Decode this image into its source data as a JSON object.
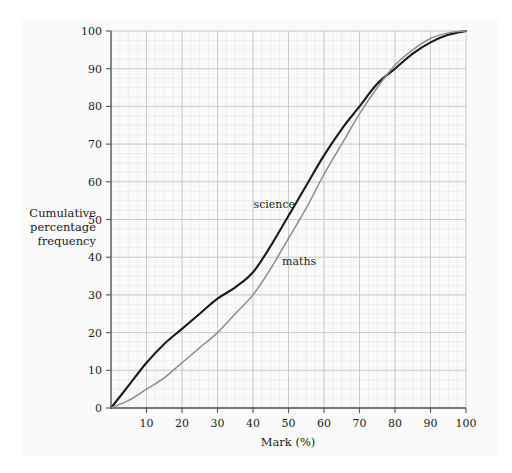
{
  "chart_data": {
    "type": "line",
    "title": "",
    "subtitle": "",
    "xlabel": "Mark (%)",
    "ylabel": "Cumulative percentage frequency",
    "xlim": [
      0,
      100
    ],
    "ylim": [
      0,
      100
    ],
    "xticks": [
      0,
      10,
      20,
      30,
      40,
      50,
      60,
      70,
      80,
      90,
      100
    ],
    "yticks": [
      0,
      10,
      20,
      30,
      40,
      50,
      60,
      70,
      80,
      90,
      100
    ],
    "xtick_labels": [
      "0",
      "10",
      "20",
      "30",
      "40",
      "50",
      "60",
      "70",
      "80",
      "90",
      "100"
    ],
    "ytick_labels": [
      "0",
      "10",
      "20",
      "30",
      "40",
      "50",
      "60",
      "70",
      "80",
      "90",
      "100"
    ],
    "grid": true,
    "grid_minor_step_x": 2.5,
    "grid_minor_step_y": 2.5,
    "legend_position": "inline-annotation",
    "x": [
      0,
      5,
      10,
      15,
      20,
      25,
      30,
      35,
      40,
      45,
      50,
      55,
      60,
      65,
      70,
      75,
      80,
      85,
      90,
      95,
      100
    ],
    "series": [
      {
        "name": "science",
        "color": "#1a1a1a",
        "width": 2.1,
        "label_x": 46,
        "label_y": 53,
        "values": [
          0,
          6,
          12,
          17,
          21,
          25,
          29,
          32,
          36,
          43,
          51,
          59,
          67,
          74,
          80,
          86,
          90,
          94,
          97,
          99,
          100
        ]
      },
      {
        "name": "maths",
        "color": "#8c8c8c",
        "width": 1.5,
        "label_x": 53,
        "label_y": 38,
        "values": [
          0,
          2,
          5,
          8,
          12,
          16,
          20,
          25,
          30,
          37,
          45,
          53,
          62,
          70,
          78,
          85,
          91,
          95,
          98,
          99.5,
          100
        ]
      }
    ],
    "annotations": [
      {
        "text": "science",
        "x": 46,
        "y": 53
      },
      {
        "text": "maths",
        "x": 53,
        "y": 38
      }
    ],
    "colors": {
      "science": "#1a1a1a",
      "maths": "#8c8c8c",
      "axis": "#555555",
      "grid_major": "#c8c8c8",
      "grid_minor": "#e4e4e4",
      "panel_background": "#fafafa",
      "page_background": "#ffffff",
      "text": "#1a1a1a"
    }
  },
  "axis": {
    "y_label_lines": [
      "Cumulative",
      "percentage",
      "frequency"
    ],
    "x_label": "Mark (%)"
  }
}
